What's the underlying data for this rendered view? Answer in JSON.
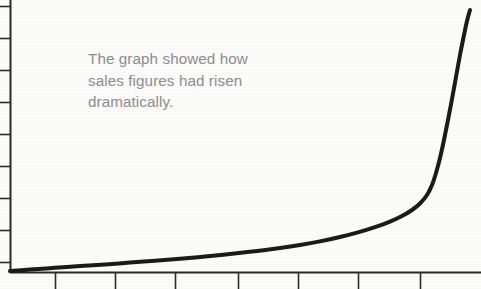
{
  "figure": {
    "background_color": "#fbfbf9",
    "caption": {
      "text": "The graph showed how\nsales figures had risen\ndramatically.",
      "color": "#8d8d8d",
      "x": 88,
      "y": 48
    }
  },
  "chart_data": {
    "type": "line",
    "title": "",
    "subtitle": "",
    "xlabel": "",
    "ylabel": "",
    "annotations": [
      "The graph showed how sales figures had risen dramatically."
    ],
    "legend": [],
    "legend_position": "none",
    "grid": false,
    "axis_color": "#2b2b2b",
    "line_color": "#1a1a1a",
    "line_width": 4,
    "xlim": [
      0,
      10
    ],
    "ylim": [
      0,
      10
    ],
    "x_tick_labels": [],
    "y_tick_labels": [],
    "x_tick_count": 7,
    "y_tick_count": 9,
    "x_tick_px": [
      55,
      115,
      175,
      238,
      298,
      358,
      420
    ],
    "y_tick_px": [
      6,
      38,
      70,
      102,
      134,
      166,
      198,
      230,
      262
    ],
    "axis_origin_px": [
      10,
      272
    ],
    "x": [
      0,
      0.5,
      1,
      1.5,
      2,
      2.5,
      3,
      3.5,
      4,
      4.5,
      5,
      5.5,
      6,
      6.5,
      7,
      7.5,
      8,
      8.5,
      9,
      9.2,
      9.4,
      9.6,
      9.8,
      10
    ],
    "values": [
      0.02,
      0.08,
      0.15,
      0.22,
      0.3,
      0.4,
      0.5,
      0.62,
      0.76,
      0.92,
      1.12,
      1.35,
      1.62,
      1.95,
      2.35,
      2.85,
      3.5,
      4.4,
      5.8,
      6.6,
      7.5,
      8.5,
      9.3,
      9.9
    ],
    "curve_points_px": [
      [
        10,
        271
      ],
      [
        30,
        269.6
      ],
      [
        55,
        267.8
      ],
      [
        80,
        266.1
      ],
      [
        105,
        264.4
      ],
      [
        130,
        262.6
      ],
      [
        155,
        260.7
      ],
      [
        180,
        258.7
      ],
      [
        205,
        256.5
      ],
      [
        230,
        254.0
      ],
      [
        255,
        251.2
      ],
      [
        280,
        248.0
      ],
      [
        300,
        245.0
      ],
      [
        320,
        241.4
      ],
      [
        340,
        237.0
      ],
      [
        358,
        232.4
      ],
      [
        375,
        227.2
      ],
      [
        390,
        221.6
      ],
      [
        402,
        216.0
      ],
      [
        412,
        210.0
      ],
      [
        420,
        203.5
      ],
      [
        427,
        195.0
      ],
      [
        432,
        185.0
      ],
      [
        436,
        173.0
      ],
      [
        440,
        158.0
      ],
      [
        444,
        140.0
      ],
      [
        448,
        120.0
      ],
      [
        452,
        99.0
      ],
      [
        456,
        77.0
      ],
      [
        460,
        55.0
      ],
      [
        464,
        35.0
      ],
      [
        467,
        21.0
      ],
      [
        470,
        10.0
      ]
    ]
  }
}
